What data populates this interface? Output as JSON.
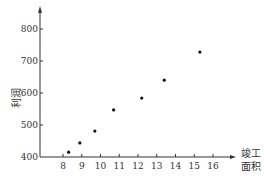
{
  "chart_data": {
    "type": "scatter",
    "title": "",
    "xlabel": "竣工面积",
    "xlabel_lines": [
      "竣工",
      "面积"
    ],
    "ylabel": "利润",
    "x": [
      8.3,
      8.9,
      9.7,
      10.7,
      12.2,
      13.4,
      15.3
    ],
    "y": [
      415,
      444,
      481,
      547,
      584,
      640,
      728
    ],
    "xticks": [
      8,
      9,
      10,
      11,
      12,
      13,
      14,
      15,
      16
    ],
    "yticks": [
      400,
      500,
      600,
      700,
      800
    ],
    "xlim": [
      6.8,
      17.5
    ],
    "ylim": [
      400,
      870
    ],
    "grid": false,
    "legend": null,
    "marker_color": "#111111",
    "axis_color": "#333333"
  }
}
